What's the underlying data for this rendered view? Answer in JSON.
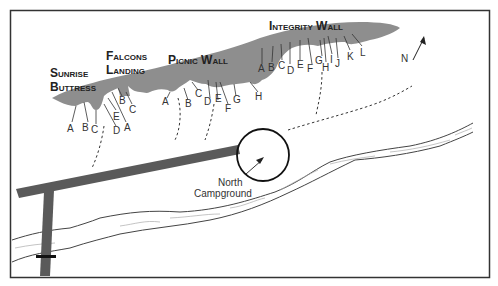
{
  "map": {
    "walls": [
      {
        "name": "Sunrise Buttress",
        "line1": "Sunrise",
        "line2": "Buttress",
        "routes": [
          "A",
          "B",
          "C"
        ]
      },
      {
        "name": "Falcons Landing",
        "line1": "Falcons",
        "line2": "Landing",
        "routes": [
          "D",
          "E",
          "A",
          "B",
          "C"
        ]
      },
      {
        "name": "Picnic Wall",
        "line1": "Picnic Wall",
        "routes": [
          "A",
          "B",
          "C",
          "D",
          "E",
          "F",
          "G",
          "H"
        ]
      },
      {
        "name": "Integrity Wall",
        "line1": "Integrity Wall",
        "routes": [
          "A",
          "B",
          "C",
          "D",
          "E",
          "F",
          "G",
          "H",
          "I",
          "J",
          "K",
          "L"
        ]
      }
    ],
    "north_label": "N",
    "campground": {
      "line1": "North",
      "line2": "Campground"
    },
    "colors": {
      "cliff": "#8e8e8e",
      "road": "#5a5a5a",
      "border": "#333333",
      "river_line": "#444444",
      "river_flow": "#aaaaaa"
    }
  }
}
